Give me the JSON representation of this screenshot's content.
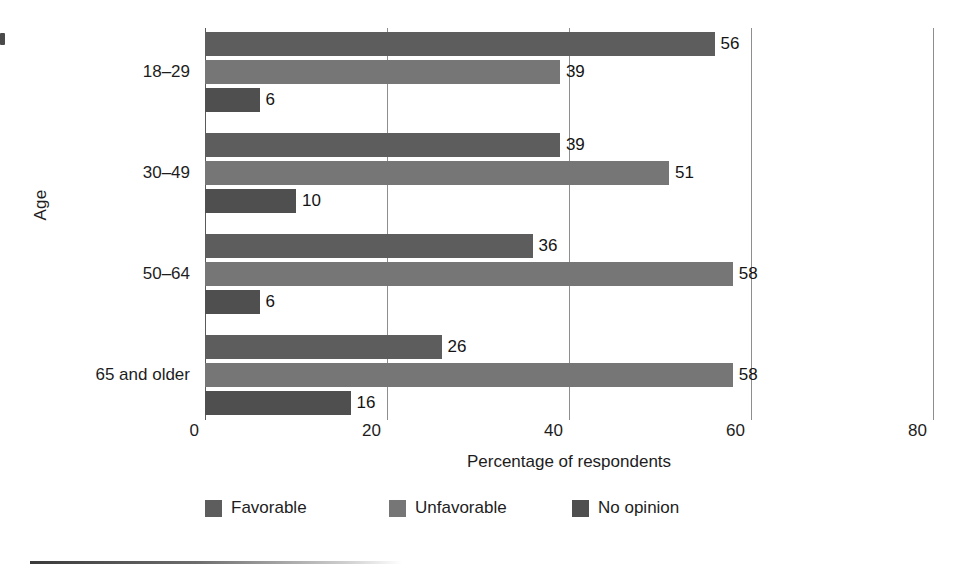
{
  "chart_data": {
    "type": "bar",
    "orientation": "horizontal",
    "title": "",
    "xlabel": "Percentage of respondents",
    "ylabel": "Age",
    "categories": [
      "18–29",
      "30–49",
      "50–64",
      "65 and older"
    ],
    "series": [
      {
        "name": "Favorable",
        "color": "#5d5d5d",
        "values": [
          56,
          39,
          36,
          26
        ]
      },
      {
        "name": "Unfavorable",
        "color": "#767676",
        "values": [
          39,
          51,
          58,
          58
        ]
      },
      {
        "name": "No opinion",
        "color": "#4f4f4f",
        "values": [
          6,
          10,
          6,
          16
        ]
      }
    ],
    "xlim": [
      0,
      80
    ],
    "xticks": [
      0,
      20,
      40,
      60,
      80
    ],
    "xtick_labels": [
      "0",
      "20",
      "40",
      "60",
      "80"
    ],
    "grid": true,
    "grid_axis": "x",
    "legend_position": "bottom",
    "data_labels": true
  },
  "axes": {
    "y_title": "Age",
    "x_title": "Percentage of respondents"
  },
  "legend": {
    "items": [
      {
        "label": "Favorable"
      },
      {
        "label": "Unfavorable"
      },
      {
        "label": "No opinion"
      }
    ]
  }
}
